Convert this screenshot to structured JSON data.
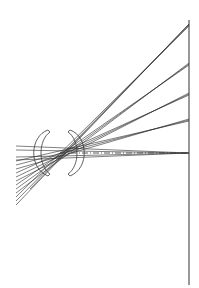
{
  "diagram": {
    "type": "optical-ray-trace",
    "colors": {
      "background": "#ffffff",
      "line": "#2a2a2a"
    },
    "image_plane": {
      "x": 189,
      "y_top": 20,
      "y_bottom": 285
    },
    "optical_axis": {
      "y": 153,
      "x_start": 16,
      "x_end": 189
    },
    "lenses": [
      {
        "name": "meniscus-lens-1",
        "x": 41,
        "y_top": 129,
        "y_bottom": 177
      },
      {
        "name": "meniscus-lens-2",
        "x": 77,
        "y_top": 129,
        "y_bottom": 177
      }
    ],
    "focus_points_y": [
      24,
      63,
      93,
      119,
      153
    ],
    "ray_entry": {
      "x": 16,
      "y_min": 146,
      "y_max": 205
    }
  }
}
